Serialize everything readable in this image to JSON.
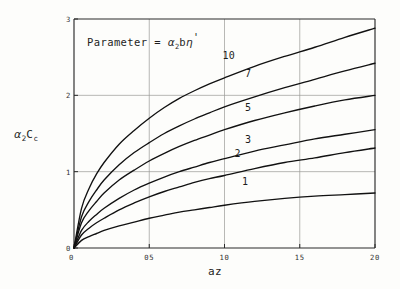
{
  "figure": {
    "background_color": "#fdfdfb",
    "ink_color": "#111111",
    "grid_color": "#9a9a96"
  },
  "annotation": {
    "prefix": "Parameter = ",
    "symbol_alpha": "α",
    "symbol_alpha_sub": "2",
    "symbol_b": "b",
    "symbol_eta": "η",
    "symbol_prime": "'",
    "full_text": "Parameter = α2bη'"
  },
  "ylabel_parts": {
    "alpha": "α",
    "alpha_sub": "2",
    "c": "C",
    "c_sub": "c",
    "full_text": "α2Cc"
  },
  "chart_data": {
    "type": "line",
    "title": "",
    "subtitle": "",
    "annotation": "Parameter = α2bη'",
    "xlabel": "az",
    "ylabel": "α2Cc",
    "xlim": [
      0,
      2.0
    ],
    "ylim": [
      0,
      3
    ],
    "xticks": [
      0,
      0.5,
      1.0,
      1.5,
      2.0
    ],
    "xtick_labels": [
      "0",
      "05",
      "10",
      "15",
      "20"
    ],
    "yticks": [
      0,
      1,
      2,
      3
    ],
    "ytick_labels": [
      "0",
      "1",
      "2",
      "3"
    ],
    "grid": true,
    "grid_x": [
      0.5,
      1.0,
      1.5
    ],
    "grid_y": [
      1,
      2
    ],
    "legend": "inline-curve-labels",
    "x": [
      0,
      0.05,
      0.1,
      0.15,
      0.2,
      0.3,
      0.4,
      0.5,
      0.6,
      0.7,
      0.8,
      0.9,
      1.0,
      1.2,
      1.4,
      1.6,
      1.8,
      2.0
    ],
    "series": [
      {
        "name": "10",
        "label": "10",
        "label_x": 1.02,
        "label_y": 2.52,
        "values": [
          0,
          0.52,
          0.78,
          0.97,
          1.12,
          1.36,
          1.54,
          1.7,
          1.84,
          1.96,
          2.06,
          2.15,
          2.23,
          2.38,
          2.51,
          2.63,
          2.76,
          2.88
        ]
      },
      {
        "name": "7",
        "label": "7",
        "label_x": 1.17,
        "label_y": 2.28,
        "values": [
          0,
          0.41,
          0.61,
          0.76,
          0.89,
          1.09,
          1.25,
          1.38,
          1.5,
          1.6,
          1.69,
          1.77,
          1.85,
          1.98,
          2.1,
          2.21,
          2.32,
          2.42
        ]
      },
      {
        "name": "5",
        "label": "5",
        "label_x": 1.17,
        "label_y": 1.83,
        "values": [
          0,
          0.33,
          0.49,
          0.61,
          0.72,
          0.89,
          1.02,
          1.14,
          1.24,
          1.33,
          1.41,
          1.48,
          1.55,
          1.67,
          1.77,
          1.86,
          1.94,
          2.0
        ]
      },
      {
        "name": "3",
        "label": "3",
        "label_x": 1.17,
        "label_y": 1.42,
        "values": [
          0,
          0.23,
          0.35,
          0.44,
          0.52,
          0.65,
          0.76,
          0.85,
          0.93,
          1.0,
          1.06,
          1.12,
          1.17,
          1.27,
          1.35,
          1.43,
          1.49,
          1.55
        ]
      },
      {
        "name": "2",
        "label": "2",
        "label_x": 1.1,
        "label_y": 1.23,
        "values": [
          0,
          0.17,
          0.26,
          0.33,
          0.39,
          0.5,
          0.59,
          0.67,
          0.74,
          0.8,
          0.86,
          0.91,
          0.95,
          1.04,
          1.12,
          1.18,
          1.25,
          1.31
        ]
      },
      {
        "name": "1",
        "label": "1",
        "label_x": 1.15,
        "label_y": 0.86,
        "values": [
          0,
          0.1,
          0.15,
          0.19,
          0.23,
          0.29,
          0.34,
          0.39,
          0.43,
          0.47,
          0.5,
          0.53,
          0.56,
          0.61,
          0.65,
          0.68,
          0.7,
          0.72
        ]
      }
    ]
  }
}
